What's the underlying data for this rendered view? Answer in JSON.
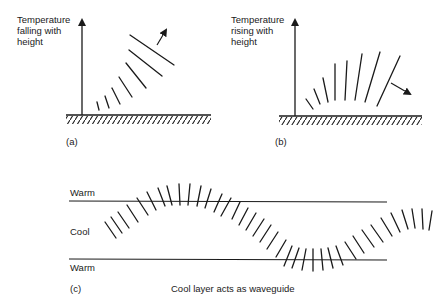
{
  "panels": {
    "a": {
      "tag": "(a)",
      "axis_label": "Temperature\nfalling with\nheight",
      "description": "Wavefronts bend upward; ray deflected away from ground"
    },
    "b": {
      "tag": "(b)",
      "axis_label": "Temperature\nrising with\nheight",
      "description": "Wavefronts bend downward; ray deflected back toward ground"
    },
    "c": {
      "tag": "(c)",
      "layers": {
        "top": "Warm",
        "middle": "Cool",
        "bottom": "Warm"
      },
      "caption": "Cool layer acts as waveguide"
    }
  },
  "colors": {
    "ink": "#1a1a1a",
    "background": "#ffffff"
  }
}
